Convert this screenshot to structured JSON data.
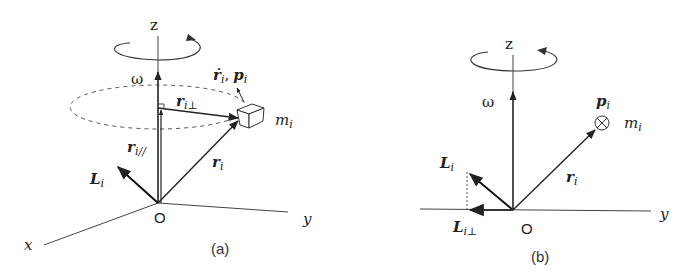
{
  "figure": {
    "panel_a": {
      "caption": "(a)",
      "axes": {
        "z": "z",
        "y": "y",
        "x": "x",
        "origin": "O"
      },
      "omega": "ω",
      "vectors": {
        "r_dot": "ṙ",
        "r_dot_sub": "i",
        "comma": ",",
        "p": "p",
        "p_sub": "i",
        "r_perp": "r",
        "r_perp_sub": "i⊥",
        "r_par": "r",
        "r_par_sub": "i//",
        "r": "r",
        "r_sub": "i",
        "L": "L",
        "L_sub": "i"
      },
      "mass": "m",
      "mass_sub": "i"
    },
    "panel_b": {
      "caption": "(b)",
      "axes": {
        "z": "z",
        "y": "y",
        "origin": "O"
      },
      "omega": "ω",
      "vectors": {
        "p": "p",
        "p_sub": "i",
        "r": "r",
        "r_sub": "i",
        "L": "L",
        "L_sub": "i",
        "L_perp": "L",
        "L_perp_sub": "i⊥"
      },
      "mass": "m",
      "mass_sub": "i",
      "mass_symbol": "⊗"
    }
  }
}
